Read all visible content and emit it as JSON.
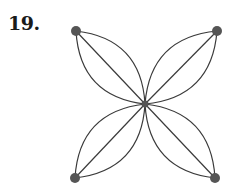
{
  "problem": {
    "label": "19."
  },
  "graph": {
    "type": "multigraph",
    "edge_color": "#3a3a3a",
    "vertex_color": "#555555",
    "vertices": [
      {
        "id": "top-left",
        "x": 76,
        "y": 31
      },
      {
        "id": "top-right",
        "x": 217,
        "y": 31
      },
      {
        "id": "center",
        "x": 145,
        "y": 104
      },
      {
        "id": "bottom-left",
        "x": 75,
        "y": 178
      },
      {
        "id": "bottom-right",
        "x": 215,
        "y": 178
      }
    ],
    "edges_per_pair": 3,
    "edges": [
      {
        "from": "top-left",
        "to": "center",
        "count": 3
      },
      {
        "from": "top-right",
        "to": "center",
        "count": 3
      },
      {
        "from": "bottom-left",
        "to": "center",
        "count": 3
      },
      {
        "from": "bottom-right",
        "to": "center",
        "count": 3
      }
    ]
  }
}
